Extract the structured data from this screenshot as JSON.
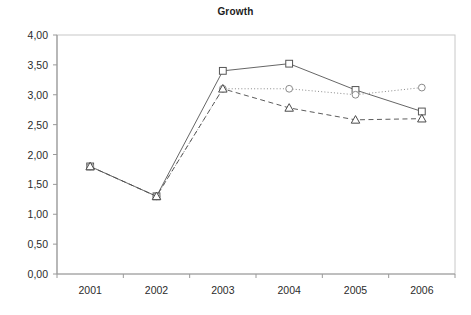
{
  "chart_data": {
    "type": "line",
    "title": "Growth",
    "xlabel": "",
    "ylabel": "",
    "categories": [
      "2001",
      "2002",
      "2003",
      "2004",
      "2005",
      "2006"
    ],
    "ylim": [
      0,
      4
    ],
    "y_ticks": [
      "0,00",
      "0,50",
      "1,00",
      "1,50",
      "2,00",
      "2,50",
      "3,00",
      "3,50",
      "4,00"
    ],
    "y_tick_values": [
      0,
      0.5,
      1,
      1.5,
      2,
      2.5,
      3,
      3.5,
      4
    ],
    "grid": false,
    "legend": "none",
    "decimal_separator": ",",
    "series": [
      {
        "name": "Series 1",
        "marker": "square",
        "line_style": "solid",
        "color": "#555555",
        "values": [
          1.8,
          1.3,
          3.4,
          3.52,
          3.08,
          2.72
        ]
      },
      {
        "name": "Series 2",
        "marker": "circle",
        "line_style": "dotted",
        "color": "#8a8a8a",
        "values": [
          1.8,
          1.3,
          3.1,
          3.1,
          3.0,
          3.12
        ]
      },
      {
        "name": "Series 3",
        "marker": "triangle",
        "line_style": "dashed",
        "color": "#4a4a4a",
        "values": [
          1.8,
          1.3,
          3.1,
          2.78,
          2.58,
          2.6
        ]
      }
    ],
    "axis_color": "#9a9a9a",
    "plot_border_color": "#c8c8c8"
  }
}
